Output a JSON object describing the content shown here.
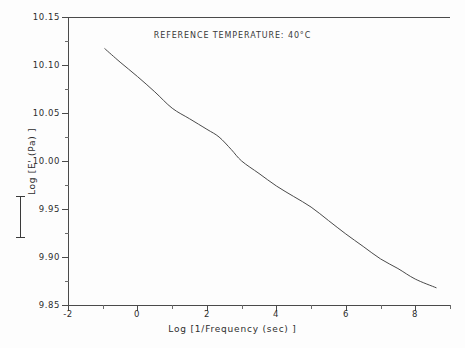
{
  "chart_data": {
    "type": "line",
    "title": "REFERENCE TEMPERATURE: 40°C",
    "xlabel": "Log [1/Frequency (sec) ]",
    "ylabel": "Log [E' (Pa) ]",
    "xlim": [
      -2,
      9
    ],
    "ylim": [
      9.85,
      10.15
    ],
    "grid": false,
    "legend": null,
    "xticks": [
      -2,
      0,
      2,
      4,
      6,
      8
    ],
    "xtick_labels": [
      "-2",
      "0",
      "2",
      "4",
      "6",
      "8"
    ],
    "xminor_ticks": [
      -1,
      1,
      3,
      5,
      7,
      9
    ],
    "yticks": [
      9.85,
      9.9,
      9.95,
      10.0,
      10.05,
      10.1,
      10.15
    ],
    "ytick_labels": [
      "9.85",
      "9.90",
      "9.95",
      "10.00",
      "10.05",
      "10.10",
      "10.15"
    ],
    "yminor_ticks": [
      9.875,
      9.925,
      9.975,
      10.025,
      10.075,
      10.125
    ],
    "series": [
      {
        "name": "Master curve",
        "color": "#4a4a4a",
        "x": [
          -0.94,
          -0.5,
          0.0,
          0.5,
          1.0,
          1.5,
          2.0,
          2.35,
          2.7,
          3.0,
          3.5,
          4.0,
          4.5,
          5.0,
          5.5,
          6.0,
          6.5,
          7.0,
          7.5,
          8.0,
          8.6
        ],
        "y": [
          10.117,
          10.103,
          10.088,
          10.072,
          10.055,
          10.044,
          10.033,
          10.025,
          10.012,
          10.0,
          9.987,
          9.974,
          9.963,
          9.952,
          9.938,
          9.924,
          9.911,
          9.898,
          9.888,
          9.877,
          9.868
        ]
      }
    ]
  },
  "axis_label_bracket": {
    "name": "y-axis-direction-bracket"
  }
}
